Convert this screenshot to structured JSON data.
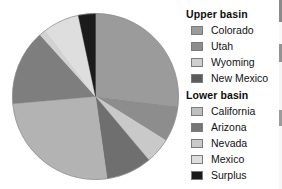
{
  "chart_data": {
    "type": "pie",
    "title": "",
    "subtitle": "",
    "xlabel": "",
    "ylabel": "",
    "grid": false,
    "legend_position": "right",
    "start_angle_deg": 0,
    "direction": "clockwise",
    "center": {
      "cx": 84.5,
      "cy": 84.5,
      "r": 83
    },
    "categories": [
      "Colorado",
      "Utah",
      "Nevada",
      "Arizona",
      "California",
      "Arizona",
      "Nevada",
      "Mexico",
      "Surplus"
    ],
    "labels": [
      "Colorado",
      "Utah",
      "Nevada",
      "Arizona",
      "California",
      "Arizona",
      "Nevada",
      "Mexico",
      "Surplus"
    ],
    "values": [
      26.9,
      6.9,
      5.0,
      8.9,
      25.8,
      14.7,
      1.4,
      7.1,
      3.3
    ],
    "colors": [
      "#9b9b9b",
      "#8d8d8d",
      "#c9c9c9",
      "#6f6f6f",
      "#b3b3b3",
      "#7e7e7e",
      "#d2d2d2",
      "#dedede",
      "#1b1b1b"
    ],
    "slices": [
      {
        "label": "Colorado",
        "start_deg": 0,
        "end_deg": 97,
        "value": 26.9,
        "color": "#9b9b9b"
      },
      {
        "label": "Utah",
        "start_deg": 97,
        "end_deg": 122,
        "value": 6.9,
        "color": "#8d8d8d"
      },
      {
        "label": "Nevada",
        "start_deg": 122,
        "end_deg": 140,
        "value": 5.0,
        "color": "#c9c9c9"
      },
      {
        "label": "Arizona",
        "start_deg": 140,
        "end_deg": 172,
        "value": 8.9,
        "color": "#6f6f6f"
      },
      {
        "label": "California",
        "start_deg": 172,
        "end_deg": 265,
        "value": 25.8,
        "color": "#b3b3b3"
      },
      {
        "label": "Arizona",
        "start_deg": 265,
        "end_deg": 318,
        "value": 14.7,
        "color": "#7e7e7e"
      },
      {
        "label": "Nevada",
        "start_deg": 318,
        "end_deg": 323,
        "value": 1.4,
        "color": "#d2d2d2"
      },
      {
        "label": "Mexico",
        "start_deg": 323,
        "end_deg": 348,
        "value": 7.1,
        "color": "#dedede"
      },
      {
        "label": "Surplus",
        "start_deg": 348,
        "end_deg": 360,
        "value": 3.3,
        "color": "#1b1b1b"
      }
    ]
  },
  "legend": {
    "groups": [
      {
        "title": "Upper basin",
        "items": [
          {
            "label": "Colorado",
            "color": "#9b9b9b"
          },
          {
            "label": "Utah",
            "color": "#8d8d8d"
          },
          {
            "label": "Wyoming",
            "color": "#cfcfcf"
          },
          {
            "label": "New Mexico",
            "color": "#5c5c5c"
          }
        ]
      },
      {
        "title": "Lower basin",
        "items": [
          {
            "label": "California",
            "color": "#bfbfbf"
          },
          {
            "label": "Arizona",
            "color": "#767676"
          },
          {
            "label": "Nevada",
            "color": "#c9c9c9"
          },
          {
            "label": "Mexico",
            "color": "#dedede"
          },
          {
            "label": "Surplus",
            "color": "#1b1b1b"
          }
        ]
      }
    ]
  }
}
